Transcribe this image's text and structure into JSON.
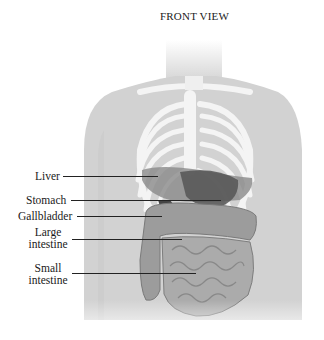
{
  "title": "FRONT VIEW",
  "labels": [
    {
      "id": "liver",
      "text": "Liver"
    },
    {
      "id": "stomach",
      "text": "Stomach"
    },
    {
      "id": "gallbladder",
      "text": "Gallbladder"
    },
    {
      "id": "large-intestine",
      "line1": "Large",
      "line2": "intestine"
    },
    {
      "id": "small-intestine",
      "line1": "Small",
      "line2": "intestine"
    }
  ],
  "colors": {
    "skin": "#d4d4d4",
    "bone": "#f2f2f2",
    "organ_dark": "#5a5a5a",
    "organ_mid": "#8e8e8e",
    "intestine": "#a8a8a8"
  }
}
